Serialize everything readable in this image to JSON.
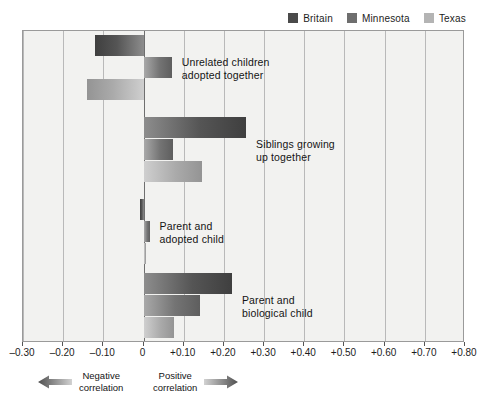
{
  "legend": {
    "position": "top-right",
    "entries": [
      {
        "label": "Britain",
        "color": "#4a4a4a",
        "key": "britain"
      },
      {
        "label": "Minnesota",
        "color": "#6e6e6e",
        "key": "minnesota"
      },
      {
        "label": "Texas",
        "color": "#b4b4b4",
        "key": "texas"
      }
    ]
  },
  "footer": {
    "negative": {
      "label": "Negative\ncorrelation",
      "icon": "left-arrow-icon"
    },
    "positive": {
      "label": "Positive\ncorrelation",
      "icon": "right-arrow-icon"
    }
  },
  "chart_data": {
    "type": "bar",
    "orientation": "horizontal",
    "title": "",
    "xlabel": "",
    "ylabel": "",
    "xlim": [
      -0.3,
      0.8
    ],
    "xticks": [
      -0.3,
      -0.2,
      -0.1,
      0,
      0.1,
      0.2,
      0.3,
      0.4,
      0.5,
      0.6,
      0.7,
      0.8
    ],
    "xticklabels": [
      "–0.30",
      "–0.20",
      "–0.10",
      "0",
      "+0.10",
      "+0.20",
      "+0.30",
      "+0.40",
      "+0.50",
      "+0.60",
      "+0.70",
      "+0.80"
    ],
    "grid": true,
    "legend_position": "top-right",
    "categories": [
      "Unrelated children\nadopted together",
      "Siblings growing\nup together",
      "Parent and\nadopted child",
      "Parent and\nbiological child"
    ],
    "series": [
      {
        "name": "Britain",
        "color": "#4a4a4a",
        "values": [
          -0.12,
          0.255,
          -0.01,
          0.22
        ]
      },
      {
        "name": "Minnesota",
        "color": "#6e6e6e",
        "values": [
          0.07,
          0.073,
          0.015,
          0.14
        ]
      },
      {
        "name": "Texas",
        "color": "#b4b4b4",
        "values": [
          -0.14,
          0.145,
          0.005,
          0.075
        ]
      }
    ]
  }
}
